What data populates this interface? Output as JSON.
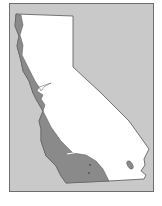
{
  "map": {
    "type": "region-map",
    "subject": "California",
    "colors": {
      "background": "#c9c9c9",
      "land": "#ffffff",
      "highlighted_region": "#8a8a8a",
      "border": "#555555",
      "frame": "#6e6e6e"
    },
    "regions": [
      {
        "name": "state-outline",
        "fill": "land"
      },
      {
        "name": "coastal-zone",
        "fill": "highlighted_region"
      }
    ]
  }
}
